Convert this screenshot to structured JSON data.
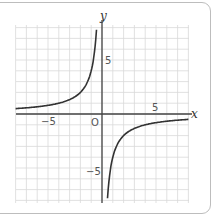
{
  "chart_data": {
    "type": "line",
    "title": "",
    "function": "y = -4/x",
    "xlabel": "x",
    "ylabel": "y",
    "xlim": [
      -8,
      8
    ],
    "ylim": [
      -8,
      8
    ],
    "grid": true,
    "x_ticks": [
      {
        "value": -5,
        "label": "−5"
      },
      {
        "value": 5,
        "label": "5"
      }
    ],
    "y_ticks": [
      {
        "value": 5,
        "label": "5"
      },
      {
        "value": -5,
        "label": "−5"
      }
    ],
    "origin_label": "O",
    "series": [
      {
        "name": "branch-left",
        "x": [
          -8,
          -6,
          -5,
          -4,
          -3,
          -2,
          -1,
          -0.6
        ],
        "y": [
          0.5,
          0.67,
          0.8,
          1,
          1.33,
          2,
          4,
          6.67
        ]
      },
      {
        "name": "branch-right",
        "x": [
          0.6,
          1,
          2,
          3,
          4,
          5,
          6,
          8
        ],
        "y": [
          -6.67,
          -4,
          -2,
          -1.33,
          -1,
          -0.8,
          -0.67,
          -0.5
        ]
      }
    ]
  },
  "labels": {
    "x_axis": "x",
    "y_axis": "y",
    "origin": "O",
    "xt_neg5": "−5",
    "xt_5": "5",
    "yt_5": "5",
    "yt_neg5": "−5"
  }
}
